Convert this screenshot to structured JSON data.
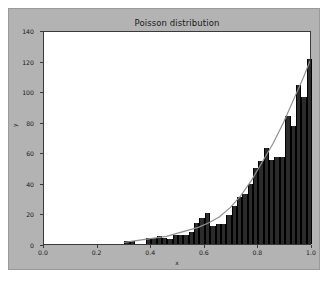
{
  "chart_data": {
    "type": "bar",
    "title": "Poisson distribution",
    "xlabel": "x",
    "ylabel": "y",
    "xlim": [
      0.0,
      1.0
    ],
    "ylim": [
      0,
      140
    ],
    "grid": false,
    "legend": null,
    "xticks": [
      "0.0",
      "0.2",
      "0.4",
      "0.6",
      "0.8",
      "1.0"
    ],
    "xtick_values": [
      0.0,
      0.2,
      0.4,
      0.6,
      0.8,
      1.0
    ],
    "yticks": [
      "0",
      "20",
      "40",
      "60",
      "80",
      "100",
      "120",
      "140"
    ],
    "ytick_values": [
      0,
      20,
      40,
      60,
      80,
      100,
      120,
      140
    ],
    "bar_color": "#2b2b2b",
    "line_color": "#8f8f8f",
    "axes_facecolor": "#ffffff",
    "figure_facecolor": "#b3b3b3",
    "bin_width": 0.02,
    "categories": [
      0.3,
      0.32,
      0.34,
      0.36,
      0.38,
      0.4,
      0.42,
      0.44,
      0.46,
      0.48,
      0.5,
      0.52,
      0.54,
      0.56,
      0.58,
      0.6,
      0.62,
      0.64,
      0.66,
      0.68,
      0.7,
      0.72,
      0.74,
      0.76,
      0.78,
      0.8,
      0.82,
      0.84,
      0.86,
      0.88,
      0.9,
      0.92,
      0.94,
      0.96,
      0.98
    ],
    "values": [
      2,
      2,
      0,
      0,
      4,
      4,
      5,
      4,
      3,
      6,
      6,
      6,
      8,
      14,
      17,
      20,
      12,
      13,
      13,
      19,
      25,
      31,
      33,
      39,
      50,
      54,
      63,
      55,
      57,
      57,
      84,
      77,
      104,
      96,
      121
    ],
    "series": [
      {
        "name": "histogram",
        "type": "bar",
        "values": [
          2,
          2,
          0,
          0,
          4,
          4,
          5,
          4,
          3,
          6,
          6,
          6,
          8,
          14,
          17,
          20,
          12,
          13,
          13,
          19,
          25,
          31,
          33,
          39,
          50,
          54,
          63,
          55,
          57,
          57,
          84,
          77,
          104,
          96,
          121
        ]
      },
      {
        "name": "fit-curve",
        "type": "line",
        "x": [
          0.3,
          0.34,
          0.38,
          0.42,
          0.46,
          0.5,
          0.54,
          0.58,
          0.62,
          0.66,
          0.7,
          0.74,
          0.78,
          0.82,
          0.86,
          0.9,
          0.94,
          0.98,
          1.0
        ],
        "y": [
          1,
          2,
          3,
          4,
          5,
          7,
          9,
          11,
          14,
          18,
          24,
          32,
          42,
          54,
          66,
          80,
          96,
          112,
          121
        ]
      }
    ]
  }
}
